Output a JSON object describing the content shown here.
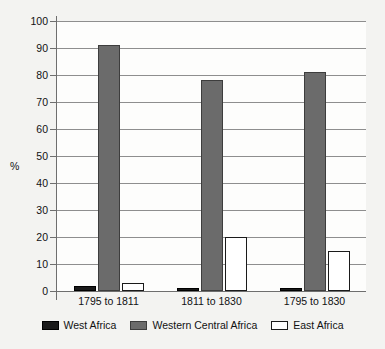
{
  "chart_data": {
    "type": "bar",
    "title": "",
    "xlabel": "",
    "ylabel": "%",
    "ylim": [
      0,
      100
    ],
    "ytick_labels": [
      "100",
      "90",
      "80",
      "70",
      "60",
      "50",
      "40",
      "30",
      "20",
      "10",
      "0"
    ],
    "ytick_values": [
      100,
      90,
      80,
      70,
      60,
      50,
      40,
      30,
      20,
      10,
      0
    ],
    "grid": true,
    "legend_position": "bottom-center",
    "categories": [
      "1795 to 1811",
      "1811 to 1830",
      "1795 to 1830"
    ],
    "series": [
      {
        "name": "West Africa",
        "color": "#1a1a1a",
        "values": [
          2,
          1,
          1
        ]
      },
      {
        "name": "Western Central Africa",
        "color": "#6b6b6b",
        "values": [
          91,
          78,
          81
        ]
      },
      {
        "name": "East Africa",
        "color": "#ffffff",
        "values": [
          3,
          20,
          15
        ]
      }
    ]
  },
  "axis": {
    "y_title": "%",
    "ticks": [
      {
        "label": "100",
        "value": 100
      },
      {
        "label": "90",
        "value": 90
      },
      {
        "label": "80",
        "value": 80
      },
      {
        "label": "70",
        "value": 70
      },
      {
        "label": "60",
        "value": 60
      },
      {
        "label": "50",
        "value": 50
      },
      {
        "label": "40",
        "value": 40
      },
      {
        "label": "30",
        "value": 30
      },
      {
        "label": "20",
        "value": 20
      },
      {
        "label": "10",
        "value": 10
      },
      {
        "label": "0",
        "value": 0
      }
    ]
  },
  "categories": [
    {
      "label": "1795 to 1811"
    },
    {
      "label": "1811 to 1830"
    },
    {
      "label": "1795 to 1830"
    }
  ],
  "legend": {
    "items": [
      {
        "label": "West Africa",
        "swatch": "west"
      },
      {
        "label": "Western Central Africa",
        "swatch": "central"
      },
      {
        "label": "East Africa",
        "swatch": "east"
      }
    ]
  },
  "colors": {
    "west_africa": "#1a1a1a",
    "western_central_africa": "#6b6b6b",
    "east_africa": "#ffffff",
    "gridline": "#8e8e8e",
    "axis": "#6e6e6e",
    "background": "#f3f3f1",
    "plot_background": "#fdfdfc"
  }
}
